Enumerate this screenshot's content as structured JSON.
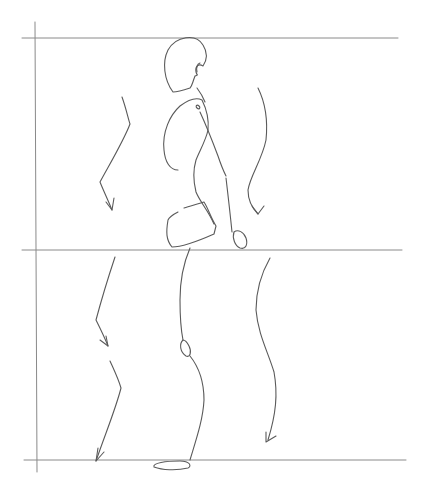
{
  "image": {
    "description": "Pencil gesture sketch of a walking figure in side profile with motion arrows, framed by guide lines",
    "background": "#ffffff",
    "stroke_color": "#5a5a5a",
    "guide_color": "#8a8a8a"
  },
  "guides": [
    {
      "name": "top-guide-line",
      "x1": 22,
      "y1": 38,
      "x2": 398,
      "y2": 38
    },
    {
      "name": "middle-guide-line",
      "x1": 22,
      "y1": 250,
      "x2": 402,
      "y2": 250
    },
    {
      "name": "bottom-guide-line",
      "x1": 24,
      "y1": 460,
      "x2": 406,
      "y2": 460
    },
    {
      "name": "left-guide-line",
      "x1": 35,
      "y1": 22,
      "x2": 37,
      "y2": 472
    }
  ],
  "figure": [
    {
      "name": "head",
      "d": "M173 92 C164 80 162 62 168 50 C176 36 196 33 203 45 C208 53 207 60 203 66 C198 63 195 67 196 72 C197 76 199 74 195 76 C192 84 192 86 190 88 C184 90 178 92 173 92 Z"
    },
    {
      "name": "ear",
      "d": "M200 63 C197 64 196 68 197 72"
    },
    {
      "name": "neck",
      "d": "M197 88 C200 92 203 97 205 102"
    },
    {
      "name": "rib-cage",
      "d": "M178 170 C170 170 165 162 164 150 C162 132 170 115 180 106 C188 100 196 97 202 100 C206 108 209 120 208 130 C206 140 200 150 196 160 C193 170 193 180 196 192 C200 202 208 210 214 224"
    },
    {
      "name": "shoulder-joint",
      "d": "M197 108 C195 106 197 104 199 106 C201 108 199 110 197 108 Z"
    },
    {
      "name": "upper-arm",
      "d": "M200 112 C206 125 212 140 218 156 C222 168 224 172 226 176"
    },
    {
      "name": "forearm",
      "d": "M226 178 C228 195 230 212 232 232"
    },
    {
      "name": "hand",
      "d": "M234 232 C232 238 235 246 240 248 C246 250 248 244 246 238 C244 232 238 229 234 232 Z"
    },
    {
      "name": "pelvis",
      "d": "M168 220 C166 232 166 240 172 247 C182 247 196 242 214 234 L216 226 C210 216 208 208 204 202 C198 204 190 206 184 208 M178 212 C174 214 170 216 168 220"
    },
    {
      "name": "thigh",
      "d": "M190 248 C184 262 180 280 180 300 C180 320 182 335 183 340"
    },
    {
      "name": "knee",
      "d": "M183 340 C179 344 180 352 186 356 C190 358 192 352 189 346 C187 342 185 340 183 340 Z"
    },
    {
      "name": "shin",
      "d": "M190 356 C198 366 204 380 204 400 C203 420 196 440 190 460"
    },
    {
      "name": "foot",
      "d": "M154 467 C152 463 166 461 180 461 C190 461 192 466 188 468 C176 471 162 470 154 467 Z"
    }
  ],
  "motion_arrows": [
    {
      "name": "arrow-upper-left",
      "d": "M122 97 C126 108 128 118 130 124 C124 140 112 160 100 182 C104 192 108 200 112 210",
      "head": "M106 202 L112 210 L114 198"
    },
    {
      "name": "arrow-upper-right",
      "d": "M258 88 C266 104 268 120 266 140 C262 160 250 176 248 190 C248 200 252 208 258 214",
      "head": "M252 206 L258 214 L264 206"
    },
    {
      "name": "arrow-lower-left-a",
      "d": "M115 257 C110 272 104 290 96 320 C100 328 104 336 108 346",
      "head": "M100 340 L108 346 L106 336"
    },
    {
      "name": "arrow-lower-left-b",
      "d": "M110 361 C114 370 118 378 121 388 C116 408 106 432 96 461",
      "head": "M98 448 L96 461 L104 452"
    },
    {
      "name": "arrow-lower-right",
      "d": "M270 258 C262 272 256 288 256 310 C258 334 268 352 274 372 C278 394 276 414 268 440",
      "head": "M266 432 L266 442 L276 436"
    }
  ]
}
